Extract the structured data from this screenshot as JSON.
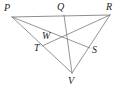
{
  "figure": {
    "background_color": "#ffffff",
    "line_color": "#7a7a7a",
    "label_color": "#1d1d1d",
    "width": 121,
    "height": 91,
    "points": {
      "P": {
        "label": "P",
        "x": 12,
        "y": 17,
        "label_x": 4,
        "label_y": 3
      },
      "Q": {
        "label": "Q",
        "x": 64,
        "y": 15,
        "label_x": 57,
        "label_y": 2
      },
      "R": {
        "label": "R",
        "x": 110,
        "y": 15,
        "label_x": 106,
        "label_y": 2
      },
      "W": {
        "label": "W",
        "x": 55,
        "y": 41,
        "label_x": 42,
        "label_y": 31
      },
      "T": {
        "label": "T",
        "x": 42,
        "y": 46,
        "label_x": 34,
        "label_y": 43
      },
      "S": {
        "label": "S",
        "x": 90,
        "y": 48,
        "label_x": 92,
        "label_y": 45
      },
      "V": {
        "label": "V",
        "x": 72,
        "y": 73,
        "label_x": 68,
        "label_y": 76
      },
      "G": {
        "label": "",
        "x": 68,
        "y": 41,
        "label_x": 0,
        "label_y": 0
      }
    },
    "segments": [
      {
        "name": "side-PR",
        "from": "P",
        "to": "R",
        "style": "base"
      },
      {
        "name": "side-PV",
        "from": "P",
        "to": "V",
        "style": "normal"
      },
      {
        "name": "side-RV",
        "from": "R",
        "to": "V",
        "style": "normal"
      },
      {
        "name": "cevian-PS",
        "from": "P",
        "to": "S",
        "style": "normal"
      },
      {
        "name": "cevian-RT",
        "from": "R",
        "to": "T",
        "style": "normal"
      },
      {
        "name": "cevian-QV",
        "from": "Q",
        "to": "V",
        "style": "normal"
      }
    ]
  }
}
